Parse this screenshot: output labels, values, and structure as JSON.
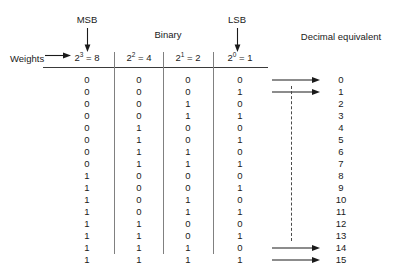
{
  "figure": {
    "title_msb": "MSB",
    "title_lsb": "LSB",
    "group_binary": "Binary",
    "group_decimal": "Decimal equivalent",
    "weights_label": "Weights",
    "accent_color": "#1a1a1a",
    "rule_color": "#3a3a3a",
    "separator_color": "#808080",
    "dash_color": "#4a4a4a"
  },
  "chart_data": {
    "type": "table",
    "columns": [
      "2^3 = 8",
      "2^2 = 4",
      "2^1 = 2",
      "2^0 = 1",
      "Decimal equivalent"
    ],
    "column_headers": [
      {
        "base": "2",
        "exponent": "3",
        "equals": " = 8"
      },
      {
        "base": "2",
        "exponent": "2",
        "equals": " = 4"
      },
      {
        "base": "2",
        "exponent": "1",
        "equals": " = 2"
      },
      {
        "base": "2",
        "exponent": "0",
        "equals": " = 1"
      }
    ],
    "rows": [
      {
        "bits": [
          "0",
          "0",
          "0",
          "0"
        ],
        "decimal": "0",
        "arrow": true
      },
      {
        "bits": [
          "0",
          "0",
          "0",
          "1"
        ],
        "decimal": "1",
        "arrow": true
      },
      {
        "bits": [
          "0",
          "0",
          "1",
          "0"
        ],
        "decimal": "2",
        "arrow": false
      },
      {
        "bits": [
          "0",
          "0",
          "1",
          "1"
        ],
        "decimal": "3",
        "arrow": false
      },
      {
        "bits": [
          "0",
          "1",
          "0",
          "0"
        ],
        "decimal": "4",
        "arrow": false
      },
      {
        "bits": [
          "0",
          "1",
          "0",
          "1"
        ],
        "decimal": "5",
        "arrow": false
      },
      {
        "bits": [
          "0",
          "1",
          "1",
          "0"
        ],
        "decimal": "6",
        "arrow": false
      },
      {
        "bits": [
          "0",
          "1",
          "1",
          "1"
        ],
        "decimal": "7",
        "arrow": false
      },
      {
        "bits": [
          "1",
          "0",
          "0",
          "0"
        ],
        "decimal": "8",
        "arrow": false
      },
      {
        "bits": [
          "1",
          "0",
          "0",
          "1"
        ],
        "decimal": "9",
        "arrow": false
      },
      {
        "bits": [
          "1",
          "0",
          "1",
          "0"
        ],
        "decimal": "10",
        "arrow": false
      },
      {
        "bits": [
          "1",
          "0",
          "1",
          "1"
        ],
        "decimal": "11",
        "arrow": false
      },
      {
        "bits": [
          "1",
          "1",
          "0",
          "0"
        ],
        "decimal": "12",
        "arrow": false
      },
      {
        "bits": [
          "1",
          "1",
          "0",
          "1"
        ],
        "decimal": "13",
        "arrow": false
      },
      {
        "bits": [
          "1",
          "1",
          "1",
          "0"
        ],
        "decimal": "14",
        "arrow": true
      },
      {
        "bits": [
          "1",
          "1",
          "1",
          "1"
        ],
        "decimal": "15",
        "arrow": true
      }
    ],
    "xlabel": "",
    "ylabel": "",
    "grid": false,
    "legend": "none"
  },
  "layout": {
    "bit_columns_x": [
      87,
      139,
      188,
      240
    ],
    "decimal_x": 341,
    "row_start_y": 74,
    "row_step": 12
  }
}
